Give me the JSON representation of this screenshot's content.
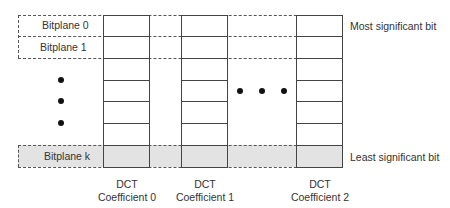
{
  "diagram": {
    "bitplanes": [
      {
        "label": "Bitplane 0"
      },
      {
        "label": "Bitplane 1"
      },
      {
        "label": "Bitplane k"
      }
    ],
    "columns": [
      {
        "line1": "DCT",
        "line2": "Coefficient 0"
      },
      {
        "line1": "DCT",
        "line2": "Coefficient 1"
      },
      {
        "line1": "DCT",
        "line2": "Coefficient 2"
      }
    ],
    "annotations": {
      "msb": "Most significant bit",
      "lsb": "Least significant bit"
    },
    "rows_per_column": 7,
    "colors": {
      "line": "#444444",
      "lsb_fill": "#e3e3e3",
      "text": "#333333"
    }
  }
}
